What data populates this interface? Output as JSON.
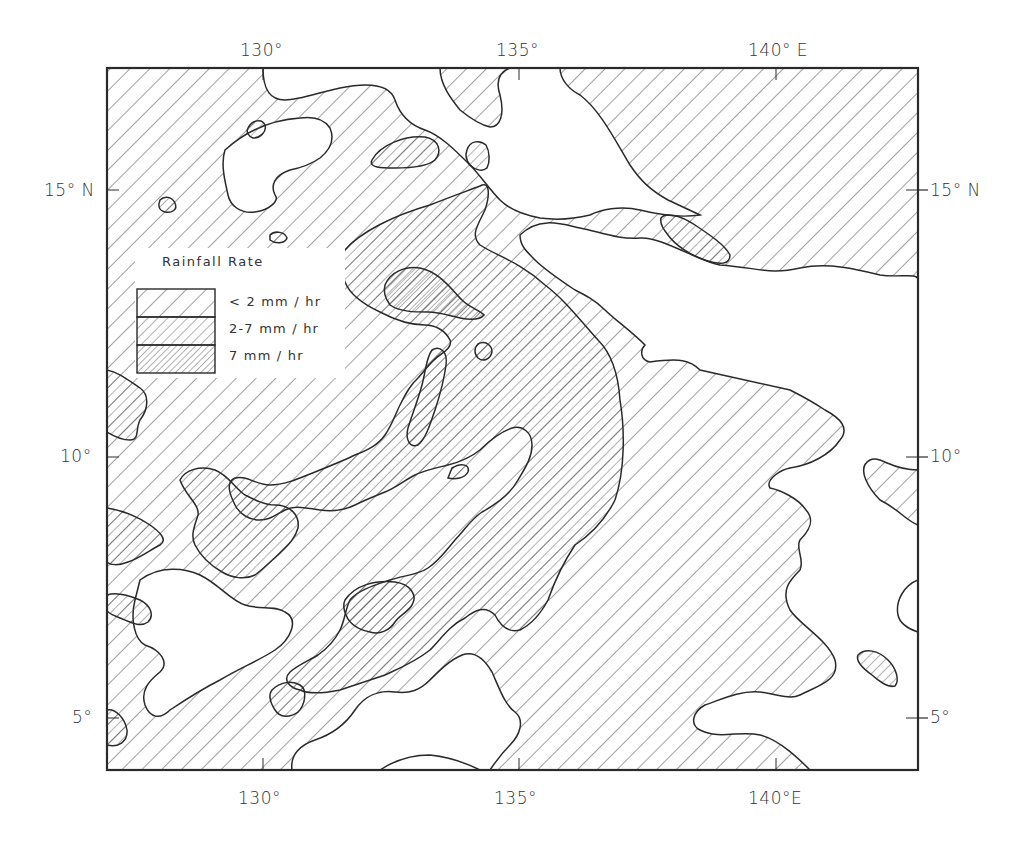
{
  "map": {
    "title": "",
    "region": "Western Pacific",
    "lon_ticks": [
      "130°",
      "135°",
      "140° E"
    ],
    "lon_ticks_bottom": [
      "130°",
      "135°",
      "140°E"
    ],
    "lat_ticks_left": [
      "15° N",
      "10°",
      "5°"
    ],
    "lat_ticks_right": [
      "15° N",
      "10°",
      "5°"
    ],
    "lon_range": [
      127.2,
      143.0
    ],
    "lat_range": [
      4.0,
      17.2
    ]
  },
  "legend": {
    "title": "Rainfall Rate",
    "items": [
      {
        "label": "< 2 mm / hr",
        "pattern": "sparse-hatch"
      },
      {
        "label": "2-7 mm / hr",
        "pattern": "medium-hatch"
      },
      {
        "label": "7 mm / hr",
        "pattern": "dense-hatch"
      }
    ]
  },
  "colors": {
    "ink": "#2a2a2a",
    "background": "#ffffff"
  }
}
